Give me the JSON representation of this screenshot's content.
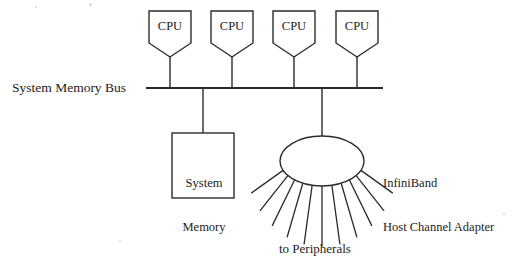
{
  "diagram": {
    "background_color": "#ffffff",
    "line_color": "#2b2b2b",
    "text_color": "#1c1c1c"
  },
  "bus": {
    "label": "System Memory Bus",
    "x_start": 146,
    "x_end": 383,
    "y": 88
  },
  "cpus": [
    {
      "label": "CPU",
      "x": 170
    },
    {
      "label": "CPU",
      "x": 232
    },
    {
      "label": "CPU",
      "x": 294
    },
    {
      "label": "CPU",
      "x": 357
    }
  ],
  "memory": {
    "label_line1": "System",
    "label_line2": "Memory",
    "stem_x": 203,
    "box": {
      "x": 172,
      "y": 133,
      "width": 62,
      "height": 65
    }
  },
  "hca": {
    "label_line1": "InfiniBand",
    "label_line2": "Host Channel Adapter",
    "stem_x": 322,
    "ellipse": {
      "cx": 322,
      "cy": 161,
      "rx": 42,
      "ry": 25
    },
    "peripheral_ray_count": 11
  },
  "peripherals": {
    "label": "to Peripherals"
  }
}
